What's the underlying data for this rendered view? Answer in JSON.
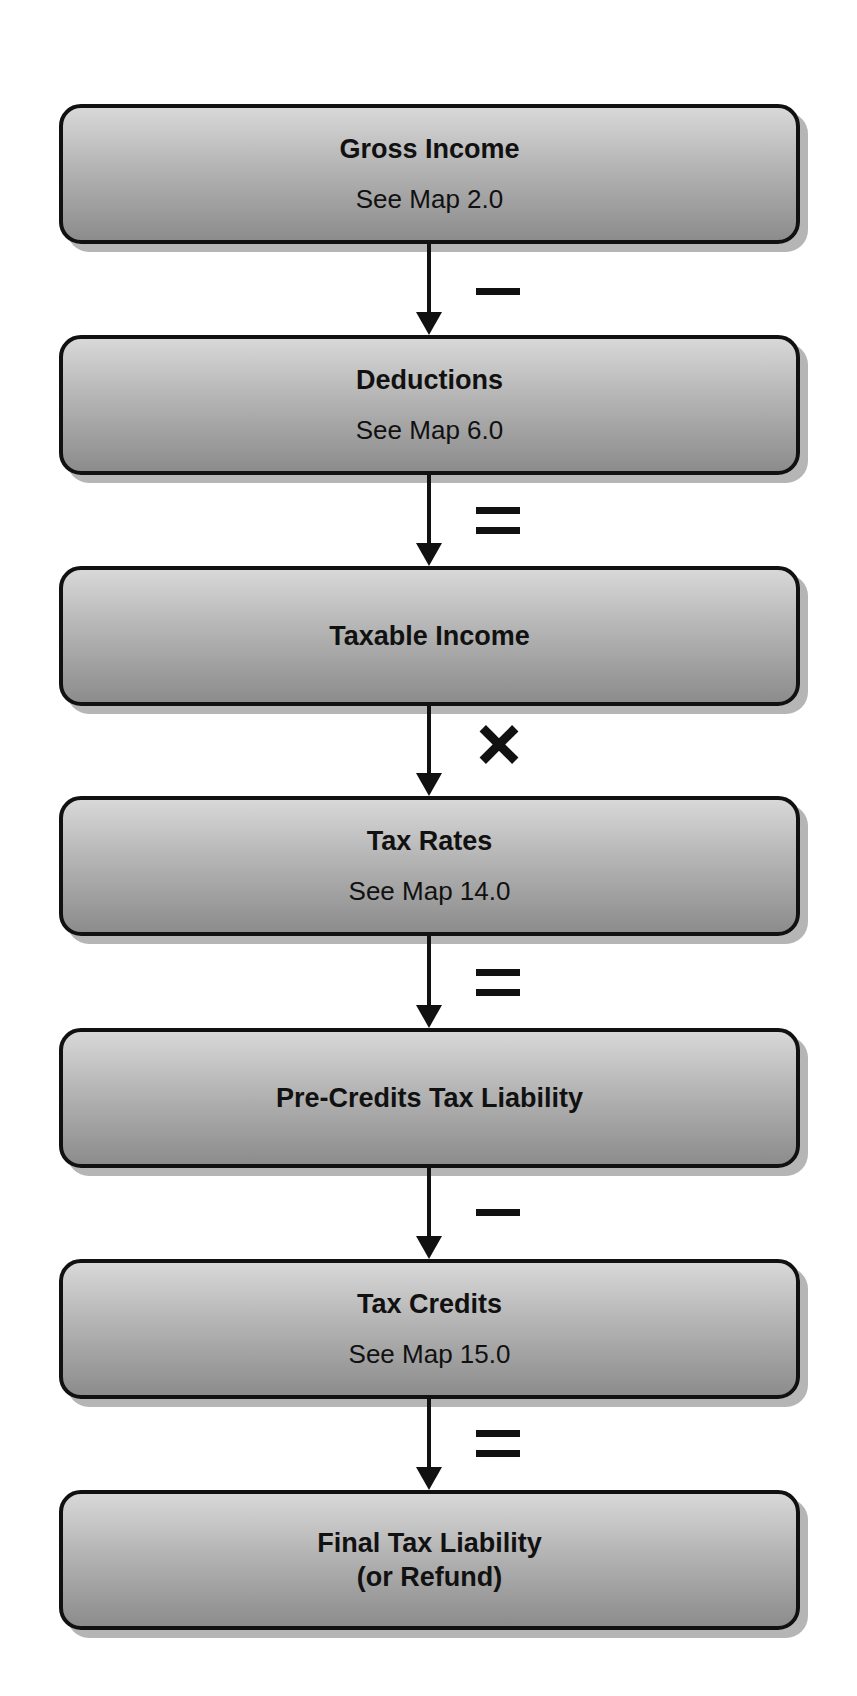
{
  "diagram": {
    "type": "flowchart",
    "direction": "top-to-bottom",
    "steps": [
      {
        "title": "Gross Income",
        "subtitle": "See Map 2.0"
      },
      {
        "title": "Deductions",
        "subtitle": "See Map 6.0"
      },
      {
        "title": "Taxable Income"
      },
      {
        "title": "Tax Rates",
        "subtitle": "See Map 14.0"
      },
      {
        "title": "Pre-Credits Tax Liability"
      },
      {
        "title": "Tax Credits",
        "subtitle": "See Map 15.0"
      },
      {
        "title": "Final Tax Liability",
        "title_line2": "(or Refund)"
      }
    ],
    "operators": [
      {
        "symbol": "minus",
        "glyph": "−"
      },
      {
        "symbol": "equals",
        "glyph": "="
      },
      {
        "symbol": "times",
        "glyph": "×"
      },
      {
        "symbol": "equals",
        "glyph": "="
      },
      {
        "symbol": "minus",
        "glyph": "−"
      },
      {
        "symbol": "equals",
        "glyph": "="
      }
    ],
    "colors": {
      "box_gradient_top": "#d8d8d8",
      "box_gradient_bottom": "#8c8c8c",
      "border": "#111111",
      "shadow": "#b5b5b5"
    }
  }
}
